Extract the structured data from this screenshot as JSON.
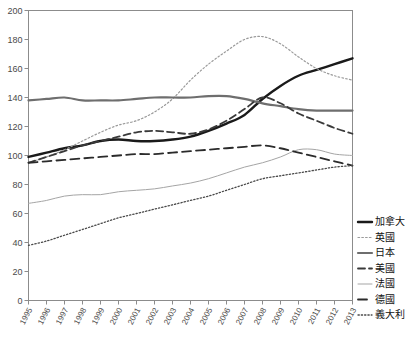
{
  "chart_data": {
    "type": "line",
    "title": "",
    "xlabel": "",
    "ylabel": "",
    "ylim": [
      0,
      200
    ],
    "ytick_step": 20,
    "yticks": [
      0,
      20,
      40,
      60,
      80,
      100,
      120,
      140,
      160,
      180,
      200
    ],
    "grid": false,
    "legend_position": "right",
    "x": [
      1995,
      1996,
      1997,
      1998,
      1999,
      2000,
      2001,
      2002,
      2003,
      2004,
      2005,
      2006,
      2007,
      2008,
      2009,
      2010,
      2011,
      2012,
      2013
    ],
    "categories": [
      "1995",
      "1996",
      "1997",
      "1998",
      "1999",
      "2000",
      "2001",
      "2002",
      "2003",
      "2004",
      "2005",
      "2006",
      "2007",
      "2008",
      "2009",
      "2010",
      "2011",
      "2012",
      "2013"
    ],
    "series": [
      {
        "name": "加拿大",
        "style": "solid-thick",
        "color": "#1a1a1a",
        "values": [
          99,
          102,
          105,
          107,
          110,
          111,
          110,
          110,
          111,
          113,
          117,
          122,
          128,
          139,
          148,
          155,
          159,
          163,
          167
        ]
      },
      {
        "name": "英國",
        "style": "dotted",
        "color": "#9a9a9a",
        "values": [
          95,
          99,
          104,
          110,
          116,
          121,
          124,
          130,
          139,
          152,
          163,
          172,
          180,
          182,
          177,
          168,
          160,
          155,
          152
        ]
      },
      {
        "name": "日本",
        "style": "solid-thick-gray",
        "color": "#6e6e6e",
        "values": [
          138,
          139,
          140,
          138,
          138,
          138,
          139,
          140,
          140,
          140,
          141,
          141,
          139,
          136,
          134,
          132,
          131,
          131,
          131
        ]
      },
      {
        "name": "美國",
        "style": "dashed",
        "color": "#3a3a3a",
        "values": [
          95,
          99,
          103,
          107,
          110,
          113,
          116,
          117,
          116,
          115,
          118,
          124,
          132,
          140,
          136,
          129,
          124,
          119,
          115
        ]
      },
      {
        "name": "法國",
        "style": "solid-thin-gray",
        "color": "#a5a5a5",
        "values": [
          67,
          69,
          72,
          73,
          73,
          75,
          76,
          77,
          79,
          81,
          84,
          88,
          92,
          95,
          99,
          104,
          104,
          101,
          100
        ]
      },
      {
        "name": "德國",
        "style": "long-dash",
        "color": "#2b2b2b",
        "values": [
          95,
          96,
          97,
          98,
          99,
          100,
          101,
          101,
          102,
          103,
          104,
          105,
          106,
          107,
          105,
          102,
          99,
          96,
          93
        ]
      },
      {
        "name": "義大利",
        "style": "fine-dotted",
        "color": "#4a4a4a",
        "values": [
          38,
          41,
          45,
          49,
          53,
          57,
          60,
          63,
          66,
          69,
          72,
          76,
          80,
          84,
          86,
          88,
          90,
          92,
          93
        ]
      }
    ]
  },
  "legend": {
    "items": [
      {
        "label": "加拿大"
      },
      {
        "label": "英國"
      },
      {
        "label": "日本"
      },
      {
        "label": "美國"
      },
      {
        "label": "法國"
      },
      {
        "label": "德國"
      },
      {
        "label": "義大利"
      }
    ]
  }
}
